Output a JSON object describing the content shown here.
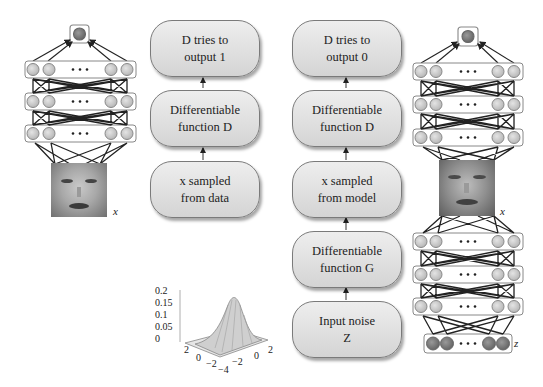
{
  "real_path": {
    "boxes": [
      {
        "label": "D tries to\noutput 1"
      },
      {
        "label": "Differentiable\nfunction D"
      },
      {
        "label": "x sampled\nfrom data"
      }
    ]
  },
  "fake_path": {
    "boxes": [
      {
        "label": "D tries to\noutput 0"
      },
      {
        "label": "Differentiable\nfunction D"
      },
      {
        "label": "x sampled\nfrom model"
      },
      {
        "label": "Differentiable\nfunction G"
      },
      {
        "label": "Input noise\nZ"
      }
    ]
  },
  "left_network": {
    "input_label": "x",
    "ellipsis": "• • •",
    "layers": 3
  },
  "right_network": {
    "image_label": "x",
    "noise_label": "z",
    "ellipsis": "• • •",
    "discriminator_layers": 3,
    "generator_layers": 3
  },
  "gaussian_plot": {
    "z_ticks": [
      "0.2",
      "0.15",
      "0.1",
      "0.05",
      "0"
    ],
    "x_ticks": [
      "2",
      "0",
      "−2",
      "−4"
    ],
    "y_ticks": [
      "−2",
      "0",
      "2"
    ]
  },
  "colors": {
    "box_top": "#eeeeee",
    "box_bottom": "#d4d4d4",
    "node": "#c8c8c8",
    "output_node": "#7a7a7a",
    "noise_node": "#8a8a8a"
  }
}
